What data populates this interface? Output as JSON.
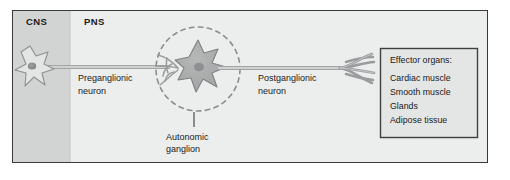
{
  "figure": {
    "title": "Autonomic nervous system two-neuron pathway diagram",
    "regions": {
      "cns_label": "CNS",
      "pns_label": "PNS"
    },
    "labels": {
      "preganglionic_line1": "Preganglionic",
      "preganglionic_line2": "neuron",
      "postganglionic_line1": "Postganglionic",
      "postganglionic_line2": "neuron",
      "ganglion_line1": "Autonomic",
      "ganglion_line2": "ganglion"
    },
    "effector_box": {
      "heading": "Effector organs:",
      "items": [
        "Cardiac muscle",
        "Smooth muscle",
        "Glands",
        "Adipose tissue"
      ]
    },
    "colors": {
      "background": "#ffffff",
      "panel_fill": "#eceded",
      "cns_fill": "#d2d3d3",
      "panel_border": "#3a3a3a",
      "box_fill": "#e4e5e5",
      "box_border": "#3f3f3f",
      "neuron_outline": "#8e9091",
      "cns_soma_fill": "#e3e4e4",
      "ganglion_soma_fill": "#a9abab",
      "nucleus_fill": "#8d8f90",
      "axon_stroke": "#a3a5a6",
      "axon_core": "#cfd0d0",
      "dashed_circle": "#8b8d8e",
      "leader_line": "#4a4a4a",
      "text": "#1a1a1a"
    }
  }
}
